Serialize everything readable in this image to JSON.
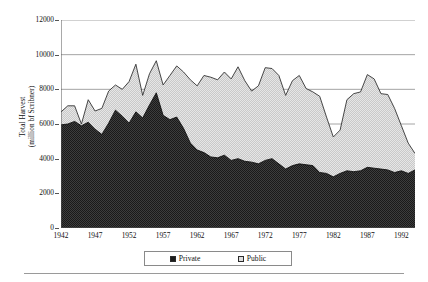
{
  "chart_data": {
    "type": "area",
    "stacked": true,
    "title": "",
    "xlabel": "",
    "ylabel": "Total Harvest (million bf Scribner)",
    "ylabel_lines": [
      "Total Harvest",
      "(million bf Scribner)"
    ],
    "ylim": [
      0,
      12000
    ],
    "ytick_values": [
      0,
      2000,
      4000,
      6000,
      8000,
      10000,
      12000
    ],
    "ytick_labels": [
      "0",
      "2000",
      "4000",
      "6000",
      "8000",
      "10000",
      "12000"
    ],
    "xlim": [
      1942,
      1994
    ],
    "xtick_labels": [
      "1942",
      "1947",
      "1952",
      "1957",
      "1962",
      "1967",
      "1972",
      "1977",
      "1982",
      "1987",
      "1992"
    ],
    "xtick_values": [
      1942,
      1947,
      1952,
      1957,
      1962,
      1967,
      1972,
      1977,
      1982,
      1987,
      1992
    ],
    "grid": "horizontal",
    "legend_position": "bottom-center",
    "colors": {
      "private": "#262626",
      "public": "#d9d9d9",
      "outline": "#333333",
      "gridline": "#9a9a9a",
      "axis": "#555555"
    },
    "x": [
      1942,
      1943,
      1944,
      1945,
      1946,
      1947,
      1948,
      1949,
      1950,
      1951,
      1952,
      1953,
      1954,
      1955,
      1956,
      1957,
      1958,
      1959,
      1960,
      1961,
      1962,
      1963,
      1964,
      1965,
      1966,
      1967,
      1968,
      1969,
      1970,
      1971,
      1972,
      1973,
      1974,
      1975,
      1976,
      1977,
      1978,
      1979,
      1980,
      1981,
      1982,
      1983,
      1984,
      1985,
      1986,
      1987,
      1988,
      1989,
      1990,
      1991,
      1992,
      1993,
      1994
    ],
    "series": [
      {
        "name": "Private",
        "values": [
          5950,
          6000,
          6150,
          5900,
          6100,
          5700,
          5400,
          6050,
          6800,
          6450,
          6050,
          6700,
          6350,
          7100,
          7800,
          6500,
          6250,
          6400,
          5750,
          4900,
          4500,
          4350,
          4100,
          4050,
          4200,
          3900,
          4000,
          3850,
          3800,
          3700,
          3900,
          4000,
          3700,
          3400,
          3600,
          3700,
          3650,
          3600,
          3200,
          3150,
          2950,
          3150,
          3300,
          3250,
          3300,
          3500,
          3450,
          3400,
          3350,
          3200,
          3300,
          3150,
          3350
        ]
      },
      {
        "name": "Public",
        "values": [
          750,
          1050,
          900,
          100,
          1300,
          1050,
          1500,
          1850,
          1450,
          1550,
          2400,
          2750,
          1300,
          1800,
          1850,
          1750,
          2550,
          2950,
          3250,
          3650,
          3700,
          4450,
          4600,
          4500,
          4800,
          4700,
          5300,
          4650,
          4100,
          4500,
          5350,
          5200,
          5100,
          4250,
          4900,
          5100,
          4400,
          4250,
          4400,
          3250,
          2300,
          2500,
          4100,
          4500,
          4550,
          5350,
          5150,
          4350,
          4350,
          3700,
          2600,
          1750,
          950
        ]
      }
    ],
    "totals": [
      6700,
      7050,
      7050,
      6000,
      7400,
      6750,
      6900,
      7900,
      8250,
      8000,
      8450,
      9450,
      7650,
      8900,
      9650,
      8250,
      8800,
      9350,
      9000,
      8550,
      8200,
      8800,
      8700,
      8550,
      9000,
      8600,
      9300,
      8500,
      7900,
      8200,
      9250,
      9200,
      8800,
      7650,
      8500,
      8800,
      8050,
      7850,
      7600,
      6400,
      5250,
      5650,
      7400,
      7750,
      7850,
      8850,
      8600,
      7750,
      7700,
      6900,
      5900,
      4900,
      4300
    ]
  },
  "legend": {
    "items": [
      {
        "label": "Private",
        "swatch": "private"
      },
      {
        "label": "Public",
        "swatch": "public"
      }
    ]
  }
}
